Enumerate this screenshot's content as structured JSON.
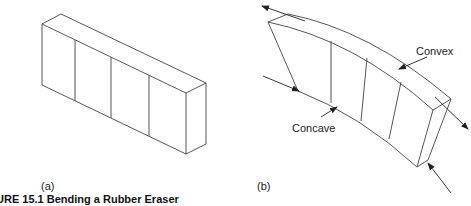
{
  "figure": {
    "caption": "URE 15.1  Bending a Rubber Eraser",
    "panel_a": {
      "label": "(a)"
    },
    "panel_b": {
      "label": "(b)",
      "annotations": {
        "convex": "Convex",
        "concave": "Concave"
      }
    },
    "colors": {
      "stroke": "#333333",
      "text": "#222222",
      "background": "#ffffff"
    }
  }
}
